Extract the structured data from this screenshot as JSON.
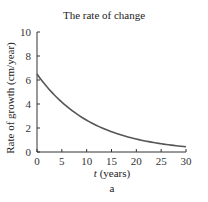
{
  "chart_data": {
    "type": "line",
    "title": "The rate of change",
    "xlabel_italic": "t",
    "xlabel_rest": " (years)",
    "xlabel": "t (years)",
    "ylabel": "Rate of growth (cm/year)",
    "sublabel": "a",
    "xlim": [
      0,
      30
    ],
    "ylim": [
      0,
      10
    ],
    "xticks": [
      0,
      5,
      10,
      15,
      20,
      25,
      30
    ],
    "yticks": [
      0,
      2,
      4,
      6,
      8,
      10
    ],
    "grid": false,
    "legend": null,
    "series": [
      {
        "name": "rate of growth",
        "color": "#555555",
        "x": [
          0,
          2.5,
          5,
          7.5,
          10,
          12.5,
          15,
          17.5,
          20,
          22.5,
          25,
          27.5,
          30
        ],
        "y": [
          6.5,
          5.18,
          4.13,
          3.29,
          2.63,
          2.09,
          1.67,
          1.33,
          1.06,
          0.85,
          0.67,
          0.54,
          0.44
        ]
      }
    ]
  }
}
